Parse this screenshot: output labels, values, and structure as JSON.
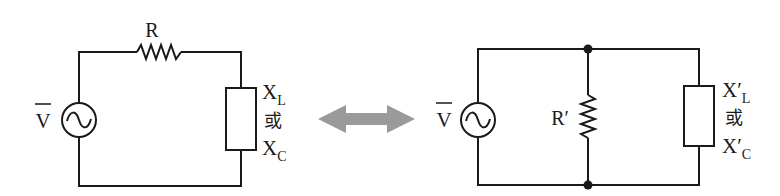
{
  "diagram": {
    "type": "circuit-equivalence",
    "left_circuit": {
      "topology": "series",
      "source_label": "V",
      "resistor_label": "R",
      "reactance_label_L_main": "X",
      "reactance_label_L_sub": "L",
      "or_label": "或",
      "reactance_label_C_main": "X",
      "reactance_label_C_sub": "C"
    },
    "arrow": {
      "kind": "double-headed",
      "color": "#9a9a9a"
    },
    "right_circuit": {
      "topology": "parallel",
      "source_label": "V",
      "resistor_label": "R′",
      "reactance_label_L_main": "X′",
      "reactance_label_L_sub": "L",
      "or_label": "或",
      "reactance_label_C_main": "X′",
      "reactance_label_C_sub": "C"
    },
    "colors": {
      "line": "#1a1a1a",
      "arrow": "#9a9a9a",
      "background": "#ffffff"
    }
  }
}
